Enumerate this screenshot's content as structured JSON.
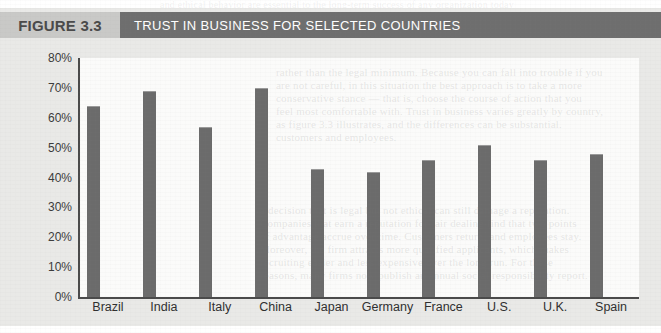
{
  "header": {
    "figure_number": "FIGURE 3.3",
    "figure_title": "TRUST IN BUSINESS FOR SELECTED COUNTRIES",
    "number_box_color": "#c9c9c7",
    "title_bar_color": "#6e6e6e",
    "title_text_color": "#ffffff"
  },
  "colors": {
    "figure_background": "#e9e9e7",
    "plot_background": "#fbfbfa",
    "bar_fill": "#6b6b6b",
    "axis_line": "#4a4a4a",
    "axis_text": "#3b3b3b"
  },
  "chart_data": {
    "type": "bar",
    "title": "TRUST IN BUSINESS FOR SELECTED COUNTRIES",
    "xlabel": "",
    "ylabel": "",
    "categories": [
      "Brazil",
      "India",
      "Italy",
      "China",
      "Japan",
      "Germany",
      "France",
      "U.S.",
      "U.K.",
      "Spain"
    ],
    "values": [
      64,
      69,
      57,
      70,
      43,
      42,
      46,
      51,
      46,
      48
    ],
    "value_labels": [
      "64%",
      "69%",
      "57%",
      "70%",
      "43%",
      "42%",
      "46%",
      "51%",
      "46%",
      "48%"
    ],
    "ylim": [
      0,
      80
    ],
    "ytick_values": [
      0,
      10,
      20,
      30,
      40,
      50,
      60,
      70,
      80
    ],
    "ytick_labels": [
      "0%",
      "10%",
      "20%",
      "30%",
      "40%",
      "50%",
      "60%",
      "70%",
      "80%"
    ],
    "grid": false,
    "legend": null,
    "legend_position": "none",
    "series": [
      {
        "name": "Trust in business",
        "values": [
          64,
          69,
          57,
          70,
          43,
          42,
          46,
          51,
          46,
          48
        ]
      }
    ]
  },
  "ghost_lines": {
    "top": "and ethical behavior are essential to the long-term success of any organization today",
    "block1": [
      "rather than the legal minimum. Because you can fall into trouble if you",
      "are not careful, in this situation the best approach is to take a more",
      "conservative stance — that is, choose the course of action that you",
      "feel most comfortable with. Trust in business varies greatly by country,",
      "as figure 3.3 illustrates, and the differences can be substantial.",
      "customers and employees."
    ],
    "block2": [
      "a decision that is legal but not ethical can still damage a reputation.",
      "Companies that earn a reputation for fair dealing find that two points",
      "of advantage accrue over time. Customers return, and employees stay.",
      "Moreover, the firm attracts more qualified applicants, which makes",
      "recruiting easier and less expensive over the long run. For these",
      "reasons, many firms now publish an annual social responsibility report."
    ]
  }
}
